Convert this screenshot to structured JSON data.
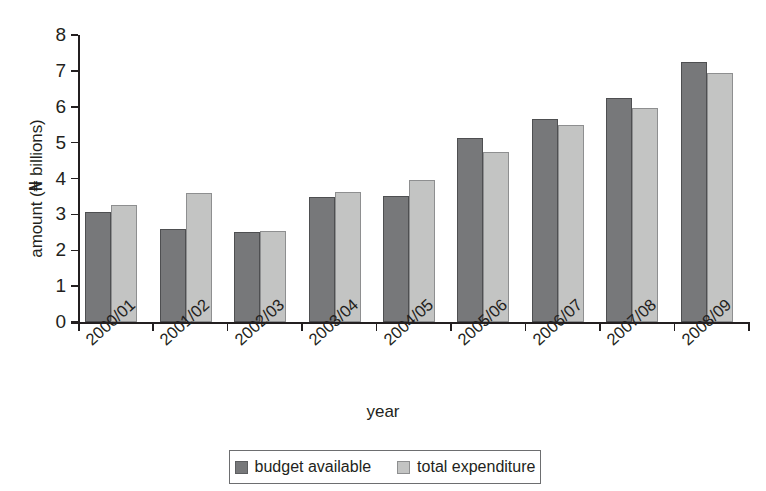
{
  "chart_data": {
    "type": "bar",
    "title": "",
    "xlabel": "year",
    "ylabel": "amount (₦ billions)",
    "ylabel_prefix": "amount (",
    "ylabel_symbol": "₦",
    "ylabel_suffix": " billions)",
    "ylim": [
      0,
      8
    ],
    "ytick_labels": [
      "0",
      "1",
      "2",
      "3",
      "4",
      "5",
      "6",
      "7",
      "8"
    ],
    "yticks": [
      0,
      1,
      2,
      3,
      4,
      5,
      6,
      7,
      8
    ],
    "grid": false,
    "legend_position": "bottom-center",
    "categories": [
      "2000/01",
      "2001/02",
      "2002/03",
      "2003/04",
      "2004/05",
      "2005/06",
      "2006/07",
      "2007/08",
      "2008/09"
    ],
    "series": [
      {
        "name": "budget available",
        "color": "#77787a",
        "values": [
          3.06,
          2.58,
          2.52,
          3.48,
          3.52,
          5.13,
          5.65,
          6.24,
          7.24
        ]
      },
      {
        "name": "total expenditure",
        "color": "#c3c4c3",
        "values": [
          3.27,
          3.61,
          2.53,
          3.62,
          3.97,
          4.74,
          5.48,
          5.96,
          6.93
        ]
      }
    ]
  },
  "legend": {
    "entries": [
      {
        "label": "budget available",
        "swatch": "dark-swatch"
      },
      {
        "label": "total expenditure",
        "swatch": "light-swatch"
      }
    ]
  }
}
